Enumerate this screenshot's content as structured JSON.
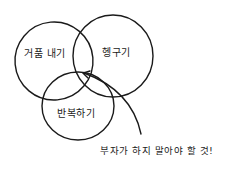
{
  "diagram": {
    "type": "venn",
    "stroke_color": "#1a1a1a",
    "background": "#ffffff",
    "sets": [
      {
        "id": "left",
        "label": "거품 내기"
      },
      {
        "id": "right",
        "label": "헹구기"
      },
      {
        "id": "bottom",
        "label": "반복하기"
      }
    ],
    "annotation": {
      "text": "부자가 하지 말아야 할 것!",
      "points_to": "intersection of all three sets"
    }
  }
}
